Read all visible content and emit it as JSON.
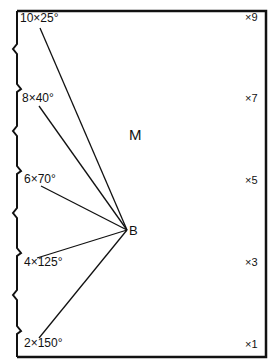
{
  "diagram": {
    "center_label": "M",
    "pivot_label": "B",
    "left_marks": [
      {
        "label": "10×25°",
        "x": 20,
        "y": 12,
        "line_x": 40,
        "line_y": 28
      },
      {
        "label": "8×40°",
        "x": 22,
        "y": 92,
        "line_x": 39,
        "line_y": 106
      },
      {
        "label": "6×70°",
        "x": 24,
        "y": 173,
        "line_x": 41,
        "line_y": 186
      },
      {
        "label": "4×125°",
        "x": 24,
        "y": 256,
        "line_x": 37,
        "line_y": 258
      },
      {
        "label": "2×150°",
        "x": 24,
        "y": 337,
        "line_x": 39,
        "line_y": 338
      }
    ],
    "right_marks": [
      {
        "label": "×9",
        "y": 12
      },
      {
        "label": "×7",
        "y": 93
      },
      {
        "label": "×5",
        "y": 175
      },
      {
        "label": "×3",
        "y": 257
      },
      {
        "label": "×1",
        "y": 339
      }
    ],
    "pivot": {
      "x": 127,
      "y": 230
    }
  }
}
